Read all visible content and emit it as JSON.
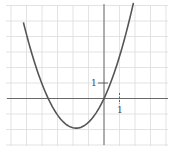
{
  "chart_data": {
    "type": "line",
    "title": "",
    "xlabel": "",
    "ylabel": "",
    "grid": true,
    "xlim": [
      -6.2,
      4.2
    ],
    "ylim": [
      -3.2,
      6.0
    ],
    "grid_spacing": 1,
    "series": [
      {
        "name": "parabola",
        "equation_approx": "y = 0.59 x (x + 3.6)",
        "x": [
          -5.2,
          -4.5,
          -4.0,
          -3.6,
          -3.0,
          -2.5,
          -1.8,
          -1.0,
          -0.5,
          0.0,
          0.4,
          1.0,
          1.5,
          1.9
        ],
        "y": [
          4.9,
          2.4,
          0.9,
          0.0,
          -1.06,
          -1.62,
          -1.91,
          -1.53,
          -0.91,
          0.0,
          0.94,
          2.71,
          4.07,
          5.6
        ]
      }
    ],
    "annotations": [
      {
        "text": "1",
        "position": "y-axis tick at y=1"
      },
      {
        "text": "1",
        "position": "x-axis tick at x=1"
      }
    ],
    "x_intercepts": [
      -3.6,
      0
    ],
    "vertex": [
      -1.8,
      -1.9
    ]
  },
  "labels": {
    "y_tick": "1",
    "x_tick": "1"
  },
  "colors": {
    "curve": "#555555",
    "axis": "#6a6a6a",
    "grid": "#dcdcdc"
  }
}
